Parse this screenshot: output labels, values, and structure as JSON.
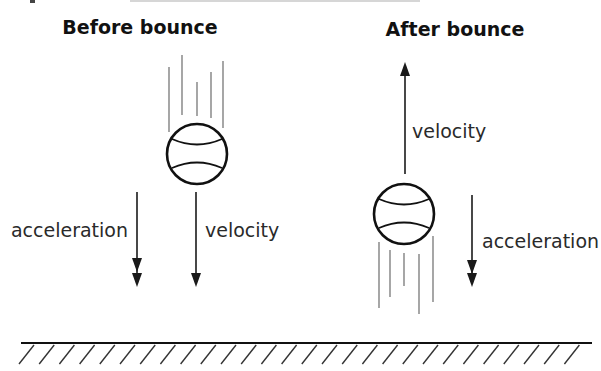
{
  "header_fragment": "",
  "panels": {
    "before": {
      "title": "Before bounce",
      "acceleration_label": "acceleration",
      "velocity_label": "velocity",
      "velocity_direction": "down",
      "acceleration_direction": "down"
    },
    "after": {
      "title": "After bounce",
      "acceleration_label": "acceleration",
      "velocity_label": "velocity",
      "velocity_direction": "up",
      "acceleration_direction": "down"
    }
  },
  "ground": {
    "label": ""
  },
  "colors": {
    "ink": "#111111",
    "motion_lines": "#777777",
    "background": "#ffffff"
  }
}
